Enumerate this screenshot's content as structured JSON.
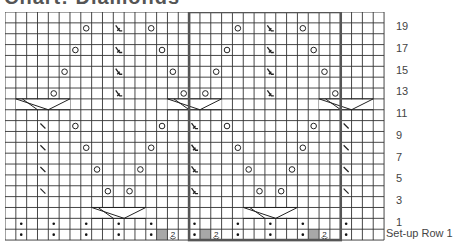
{
  "title": "Chart: Diamonds",
  "chart_data": {
    "type": "table",
    "columns": 35,
    "rows": 21,
    "repeat_box": {
      "col_start": 17,
      "col_end": 30,
      "row_start": 0,
      "row_end": 20
    },
    "row_labels": [
      {
        "index": 1,
        "text": "19"
      },
      {
        "index": 3,
        "text": "17"
      },
      {
        "index": 5,
        "text": "15"
      },
      {
        "index": 7,
        "text": "13"
      },
      {
        "index": 9,
        "text": "11"
      },
      {
        "index": 11,
        "text": "9"
      },
      {
        "index": 13,
        "text": "7"
      },
      {
        "index": 15,
        "text": "5"
      },
      {
        "index": 17,
        "text": "3"
      },
      {
        "index": 19,
        "text": "1"
      },
      {
        "index": 20,
        "text": "Set-up Row 1"
      }
    ],
    "symbols": [
      {
        "row": 1,
        "col": 7,
        "type": "yo"
      },
      {
        "row": 1,
        "col": 10,
        "type": "dec"
      },
      {
        "row": 1,
        "col": 13,
        "type": "yo"
      },
      {
        "row": 1,
        "col": 21,
        "type": "yo"
      },
      {
        "row": 1,
        "col": 24,
        "type": "dec"
      },
      {
        "row": 1,
        "col": 27,
        "type": "yo"
      },
      {
        "row": 3,
        "col": 6,
        "type": "yo"
      },
      {
        "row": 3,
        "col": 10,
        "type": "dec"
      },
      {
        "row": 3,
        "col": 14,
        "type": "yo"
      },
      {
        "row": 3,
        "col": 20,
        "type": "yo"
      },
      {
        "row": 3,
        "col": 24,
        "type": "dec"
      },
      {
        "row": 3,
        "col": 28,
        "type": "yo"
      },
      {
        "row": 5,
        "col": 5,
        "type": "yo"
      },
      {
        "row": 5,
        "col": 10,
        "type": "dec"
      },
      {
        "row": 5,
        "col": 15,
        "type": "yo"
      },
      {
        "row": 5,
        "col": 19,
        "type": "yo"
      },
      {
        "row": 5,
        "col": 24,
        "type": "dec"
      },
      {
        "row": 5,
        "col": 29,
        "type": "yo"
      },
      {
        "row": 7,
        "col": 4,
        "type": "yo"
      },
      {
        "row": 7,
        "col": 10,
        "type": "dec"
      },
      {
        "row": 7,
        "col": 16,
        "type": "yo"
      },
      {
        "row": 7,
        "col": 18,
        "type": "yo"
      },
      {
        "row": 7,
        "col": 24,
        "type": "dec"
      },
      {
        "row": 7,
        "col": 30,
        "type": "yo"
      },
      {
        "row": 10,
        "col": 3,
        "type": "k2tog"
      },
      {
        "row": 10,
        "col": 6,
        "type": "yo"
      },
      {
        "row": 10,
        "col": 14,
        "type": "yo"
      },
      {
        "row": 10,
        "col": 17,
        "type": "dec"
      },
      {
        "row": 10,
        "col": 20,
        "type": "yo"
      },
      {
        "row": 10,
        "col": 28,
        "type": "yo"
      },
      {
        "row": 10,
        "col": 31,
        "type": "k2tog"
      },
      {
        "row": 12,
        "col": 3,
        "type": "k2tog"
      },
      {
        "row": 12,
        "col": 7,
        "type": "yo"
      },
      {
        "row": 12,
        "col": 13,
        "type": "yo"
      },
      {
        "row": 12,
        "col": 17,
        "type": "dec"
      },
      {
        "row": 12,
        "col": 21,
        "type": "yo"
      },
      {
        "row": 12,
        "col": 27,
        "type": "yo"
      },
      {
        "row": 12,
        "col": 31,
        "type": "k2tog"
      },
      {
        "row": 14,
        "col": 3,
        "type": "k2tog"
      },
      {
        "row": 14,
        "col": 8,
        "type": "yo"
      },
      {
        "row": 14,
        "col": 12,
        "type": "yo"
      },
      {
        "row": 14,
        "col": 17,
        "type": "dec"
      },
      {
        "row": 14,
        "col": 22,
        "type": "yo"
      },
      {
        "row": 14,
        "col": 26,
        "type": "yo"
      },
      {
        "row": 14,
        "col": 31,
        "type": "k2tog"
      },
      {
        "row": 16,
        "col": 3,
        "type": "k2tog"
      },
      {
        "row": 16,
        "col": 9,
        "type": "yo"
      },
      {
        "row": 16,
        "col": 11,
        "type": "yo"
      },
      {
        "row": 16,
        "col": 17,
        "type": "dec"
      },
      {
        "row": 16,
        "col": 23,
        "type": "yo"
      },
      {
        "row": 16,
        "col": 25,
        "type": "yo"
      },
      {
        "row": 16,
        "col": 31,
        "type": "k2tog"
      },
      {
        "row": 19,
        "col": 1,
        "type": "purl"
      },
      {
        "row": 19,
        "col": 4,
        "type": "purl"
      },
      {
        "row": 19,
        "col": 7,
        "type": "purl"
      },
      {
        "row": 19,
        "col": 10,
        "type": "purl"
      },
      {
        "row": 19,
        "col": 13,
        "type": "purl"
      },
      {
        "row": 19,
        "col": 17,
        "type": "purl"
      },
      {
        "row": 19,
        "col": 21,
        "type": "purl"
      },
      {
        "row": 19,
        "col": 24,
        "type": "purl"
      },
      {
        "row": 19,
        "col": 27,
        "type": "purl"
      },
      {
        "row": 19,
        "col": 31,
        "type": "purl"
      },
      {
        "row": 20,
        "col": 1,
        "type": "purl"
      },
      {
        "row": 20,
        "col": 4,
        "type": "purl"
      },
      {
        "row": 20,
        "col": 7,
        "type": "purl"
      },
      {
        "row": 20,
        "col": 10,
        "type": "purl"
      },
      {
        "row": 20,
        "col": 13,
        "type": "purl"
      },
      {
        "row": 20,
        "col": 17,
        "type": "purl"
      },
      {
        "row": 20,
        "col": 21,
        "type": "purl"
      },
      {
        "row": 20,
        "col": 24,
        "type": "purl"
      },
      {
        "row": 20,
        "col": 27,
        "type": "purl"
      },
      {
        "row": 20,
        "col": 31,
        "type": "purl"
      },
      {
        "row": 20,
        "col": 14,
        "type": "nostitch"
      },
      {
        "row": 20,
        "col": 15,
        "type": "m2"
      },
      {
        "row": 20,
        "col": 18,
        "type": "nostitch"
      },
      {
        "row": 20,
        "col": 19,
        "type": "m2"
      },
      {
        "row": 20,
        "col": 28,
        "type": "nostitch"
      },
      {
        "row": 20,
        "col": 29,
        "type": "m2"
      }
    ],
    "cables": [
      {
        "row": 8,
        "col": 1,
        "width": 5
      },
      {
        "row": 8,
        "col": 15,
        "width": 5
      },
      {
        "row": 8,
        "col": 29,
        "width": 5
      },
      {
        "row": 18,
        "col": 8,
        "width": 5
      },
      {
        "row": 18,
        "col": 22,
        "width": 5
      }
    ]
  }
}
